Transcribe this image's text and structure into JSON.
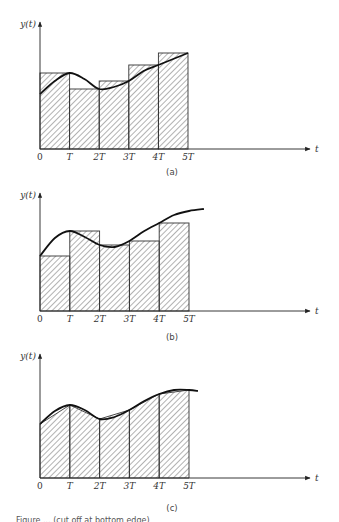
{
  "figure": {
    "panels": [
      {
        "label": "(a)",
        "y_axis_label": "y(t)",
        "x_axis_label": "t",
        "x_ticks": [
          "0",
          "T",
          "2T",
          "3T",
          "4T",
          "5T"
        ],
        "method": "rectangles with height at right endpoint"
      },
      {
        "label": "(b)",
        "y_axis_label": "y(t)",
        "x_axis_label": "t",
        "x_ticks": [
          "0",
          "T",
          "2T",
          "3T",
          "4T",
          "5T"
        ],
        "method": "rectangles with height at left endpoint"
      },
      {
        "label": "(c)",
        "y_axis_label": "y(t)",
        "x_axis_label": "t",
        "x_ticks": [
          "0",
          "T",
          "2T",
          "3T",
          "4T",
          "5T"
        ],
        "method": "trapezoids"
      }
    ],
    "caption_visible": "Figure ... (cut off at bottom edge)"
  },
  "chart_data": [
    {
      "type": "bar",
      "title": "(a)",
      "xlabel": "t",
      "ylabel": "y(t)",
      "categories": [
        "0–T",
        "T–2T",
        "2T–3T",
        "3T–4T",
        "4T–5T"
      ],
      "values": [
        76,
        60,
        68,
        84,
        96
      ],
      "curve": {
        "t": [
          0,
          0.5,
          1,
          1.5,
          2,
          2.5,
          3,
          3.5,
          4,
          4.5,
          5
        ],
        "y": [
          55,
          68,
          76,
          70,
          60,
          62,
          68,
          78,
          84,
          90,
          96
        ]
      },
      "x_ticks": [
        "0",
        "T",
        "2T",
        "3T",
        "4T",
        "5T"
      ],
      "ylim": [
        0,
        120
      ],
      "xlim_T": [
        0,
        9.5
      ],
      "grid": false,
      "hatched": true,
      "note": "rectangle height equals y at right endpoint of each interval; y units arbitrary (no y ticks)"
    },
    {
      "type": "bar",
      "title": "(b)",
      "xlabel": "t",
      "ylabel": "y(t)",
      "categories": [
        "0–T",
        "T–2T",
        "2T–3T",
        "3T–4T",
        "4T–5T"
      ],
      "values": [
        55,
        80,
        66,
        70,
        88
      ],
      "curve": {
        "t": [
          0,
          0.5,
          1,
          1.5,
          2,
          2.5,
          3,
          3.5,
          4,
          4.5,
          5,
          5.5
        ],
        "y": [
          55,
          73,
          80,
          74,
          66,
          64,
          70,
          80,
          88,
          96,
          100,
          102
        ]
      },
      "x_ticks": [
        "0",
        "T",
        "2T",
        "3T",
        "4T",
        "5T"
      ],
      "ylim": [
        0,
        120
      ],
      "xlim_T": [
        0,
        9.5
      ],
      "grid": false,
      "hatched": true,
      "note": "rectangle height equals y at left endpoint of each interval"
    },
    {
      "type": "area",
      "title": "(c)",
      "xlabel": "t",
      "ylabel": "y(t)",
      "x": [
        "0",
        "T",
        "2T",
        "3T",
        "4T",
        "5T"
      ],
      "values": [
        54,
        73,
        59,
        68,
        84,
        88
      ],
      "curve": {
        "t": [
          0,
          0.5,
          1,
          1.5,
          2,
          2.5,
          3,
          3.5,
          4,
          4.5,
          5,
          5.3
        ],
        "y": [
          54,
          67,
          73,
          68,
          59,
          61,
          68,
          77,
          84,
          88,
          88,
          87
        ]
      },
      "x_ticks": [
        "0",
        "T",
        "2T",
        "3T",
        "4T",
        "5T"
      ],
      "ylim": [
        0,
        120
      ],
      "xlim_T": [
        0,
        9.5
      ],
      "grid": false,
      "hatched": true,
      "note": "trapezoids connecting samples y(kT)"
    }
  ]
}
